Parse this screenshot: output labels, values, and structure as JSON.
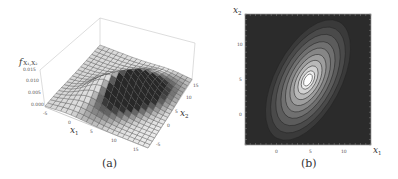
{
  "figure": {
    "panels": [
      {
        "id": "a",
        "caption": "(a)"
      },
      {
        "id": "b",
        "caption": "(b)"
      }
    ]
  },
  "chart_data": [
    {
      "type": "surface3d",
      "panel": "(a)",
      "title": "",
      "zlabel": "f X1,X2",
      "xlabel": "x1",
      "ylabel": "x2",
      "x_ticks": [
        "-5",
        "0",
        "5",
        "10",
        "15"
      ],
      "y_ticks": [
        "-5",
        "0",
        "5",
        "10",
        "15"
      ],
      "z_ticks": [
        "0.000",
        "0.005",
        "0.010",
        "0.015"
      ],
      "xlim": [
        -5,
        15
      ],
      "ylim": [
        -5,
        15
      ],
      "zlim": [
        0,
        0.015
      ],
      "description": "Bivariate normal density surface with peak near (5, 5), positively correlated",
      "peak": {
        "x1": 5,
        "x2": 5,
        "value": 0.0135
      },
      "grid": true,
      "shading": "grayscale"
    },
    {
      "type": "contour",
      "panel": "(b)",
      "xlabel": "x1",
      "ylabel": "x2",
      "x_ticks": [
        "0",
        "5",
        "10"
      ],
      "y_ticks": [
        "0",
        "5",
        "10"
      ],
      "xlim": [
        -5,
        15
      ],
      "ylim": [
        -5,
        15
      ],
      "center": {
        "x1": 5,
        "x2": 5
      },
      "levels": 9,
      "orientation": "ellipses tilted ~60° (positive correlation)",
      "colors": {
        "background": "#2b2b2b",
        "peak": "#ffffff"
      }
    }
  ],
  "labels": {
    "a": {
      "zlabel_main": "f",
      "zlabel_sub": "X₁,X₂",
      "x_axis_label": "x",
      "x_axis_sub": "1",
      "y_axis_label": "x",
      "y_axis_sub": "2",
      "z_ticks": [
        "0.015",
        "0.010",
        "0.005",
        "0.000"
      ],
      "x_ticks": [
        "-5",
        "0",
        "5",
        "10",
        "15"
      ],
      "y_ticks": [
        "15",
        "10",
        "5",
        "0",
        "-5"
      ]
    },
    "b": {
      "x_axis_label": "x",
      "x_axis_sub": "1",
      "y_axis_label": "x",
      "y_axis_sub": "2",
      "x_ticks": [
        "0",
        "5",
        "10"
      ],
      "y_ticks": [
        "10",
        "5",
        "0"
      ]
    }
  }
}
